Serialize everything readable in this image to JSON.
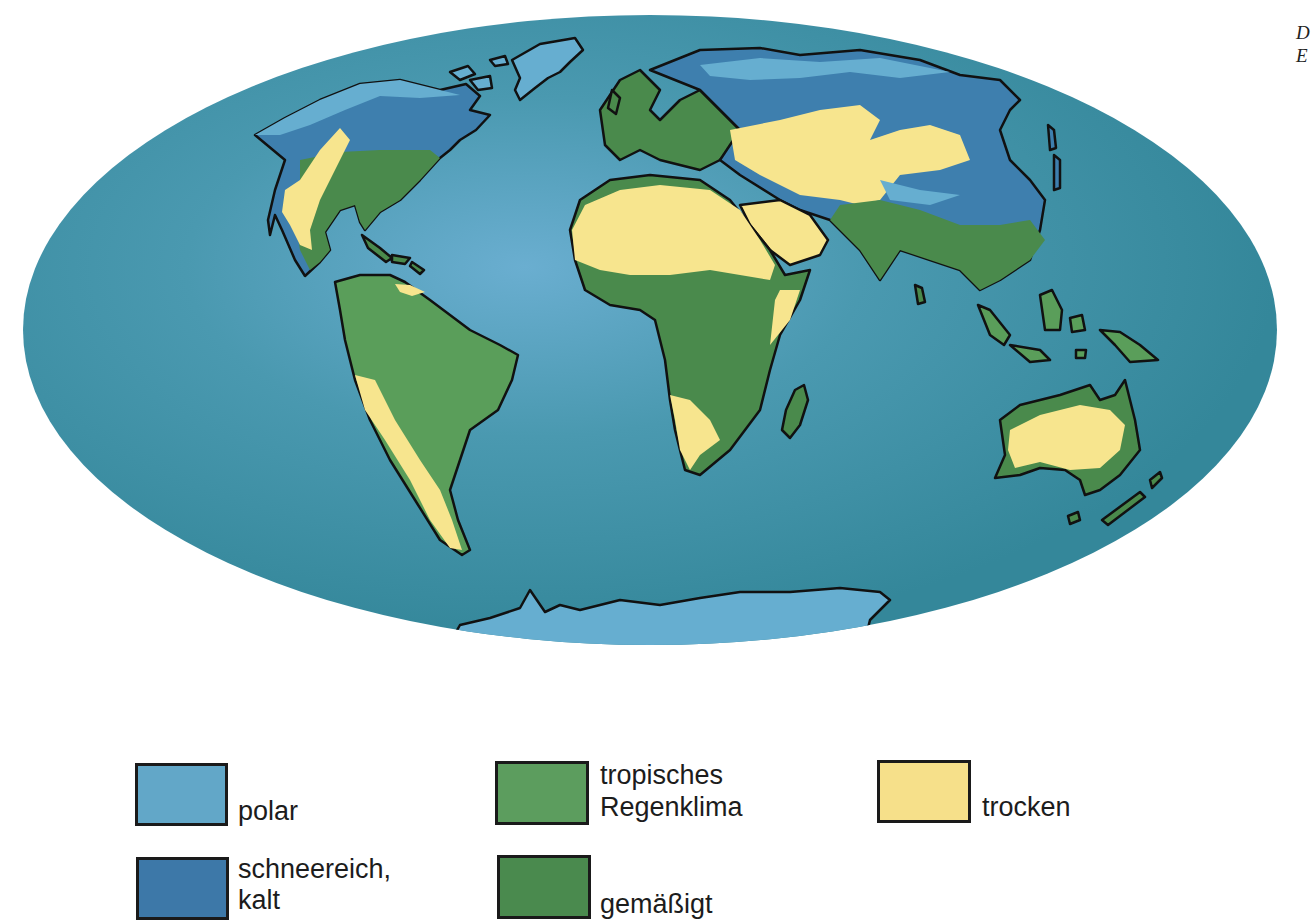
{
  "colors": {
    "ocean": "#3b8f9f",
    "ocean_light": "#5ea9c6",
    "polar": "#66aed0",
    "snow_cold": "#3e7fae",
    "tropical": "#5a9e5a",
    "temperate": "#4a8a4c",
    "dry": "#f7e58e",
    "outline": "#111111"
  },
  "corner_text": {
    "line1": "D",
    "line2": "E"
  },
  "legend": [
    {
      "key": "polar",
      "label_line1": "",
      "label_line2": "polar",
      "color": "#62a7c8"
    },
    {
      "key": "snow_cold",
      "label_line1": "schneereich,",
      "label_line2": "kalt",
      "color": "#3d78a8"
    },
    {
      "key": "tropical",
      "label_line1": "tropisches",
      "label_line2": "Regenklima",
      "color": "#5c9d5e"
    },
    {
      "key": "temperate",
      "label_line1": "",
      "label_line2": "gemäßigt",
      "color": "#4a8a4e"
    },
    {
      "key": "dry",
      "label_line1": "",
      "label_line2": "trocken",
      "color": "#f6e08a"
    }
  ]
}
